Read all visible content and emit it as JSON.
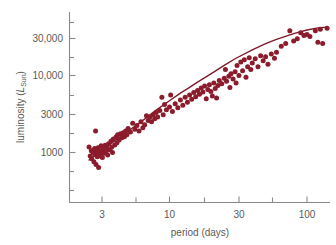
{
  "figure": {
    "name": "period-luminosity-diagram",
    "background": "#ffffff",
    "point_color": "#8b1c2c",
    "line_color": "#7d1a29",
    "axis_color": "#8a8a8a",
    "text_color": "#5a5a5a"
  },
  "axes": {
    "x_title": "period (days)",
    "y_title_main": "luminosity (",
    "y_title_italic": "L",
    "y_title_sub": "Sun",
    "y_title_close": ")",
    "x_tick_labels": [
      "3",
      "10",
      "30",
      "100"
    ],
    "y_tick_labels": [
      "1000",
      "3000",
      "10,000",
      "30,000"
    ]
  },
  "chart_data": {
    "type": "scatter",
    "title": "",
    "xlabel": "period (days)",
    "ylabel": "luminosity (L_Sun)",
    "xscale": "log",
    "yscale": "log",
    "xlim": [
      2.0,
      160
    ],
    "ylim": [
      400,
      70000
    ],
    "xticks": [
      3,
      10,
      30,
      100
    ],
    "xtick_labels": [
      "3",
      "10",
      "30",
      "100"
    ],
    "x_minor_ticks": [
      5,
      20,
      50
    ],
    "yticks": [
      1000,
      3000,
      10000,
      30000
    ],
    "ytick_labels": [
      "1000",
      "3000",
      "10,000",
      "30,000"
    ],
    "y_minor_ticks": [
      500,
      2000,
      5000,
      20000,
      50000
    ],
    "grid": false,
    "legend": false,
    "series": [
      {
        "name": "Cepheid variables",
        "marker": "filled-circle",
        "color": "#8b1c2c",
        "points": [
          [
            2.6,
            1180
          ],
          [
            2.65,
            900
          ],
          [
            2.7,
            1050
          ],
          [
            2.72,
            830
          ],
          [
            2.78,
            1000
          ],
          [
            2.82,
            760
          ],
          [
            2.85,
            1130
          ],
          [
            2.88,
            940
          ],
          [
            2.9,
            1900
          ],
          [
            2.92,
            700
          ],
          [
            2.95,
            1020
          ],
          [
            2.98,
            880
          ],
          [
            3.0,
            1000
          ],
          [
            3.02,
            1150
          ],
          [
            3.05,
            640
          ],
          [
            3.08,
            980
          ],
          [
            3.1,
            1060
          ],
          [
            3.15,
            900
          ],
          [
            3.18,
            1220
          ],
          [
            3.2,
            1000
          ],
          [
            3.25,
            860
          ],
          [
            3.3,
            1100
          ],
          [
            3.35,
            980
          ],
          [
            3.4,
            1240
          ],
          [
            3.45,
            1020
          ],
          [
            3.5,
            1150
          ],
          [
            3.55,
            930
          ],
          [
            3.6,
            1300
          ],
          [
            3.7,
            1080
          ],
          [
            3.75,
            1400
          ],
          [
            3.8,
            1180
          ],
          [
            3.85,
            1000
          ],
          [
            3.9,
            1500
          ],
          [
            4.0,
            1250
          ],
          [
            4.1,
            1600
          ],
          [
            4.15,
            1340
          ],
          [
            4.2,
            1700
          ],
          [
            4.3,
            1450
          ],
          [
            4.4,
            1750
          ],
          [
            4.5,
            1560
          ],
          [
            4.6,
            1800
          ],
          [
            4.7,
            1600
          ],
          [
            4.8,
            1900
          ],
          [
            4.9,
            1700
          ],
          [
            5.0,
            2050
          ],
          [
            5.2,
            1850
          ],
          [
            5.4,
            2400
          ],
          [
            5.6,
            2000
          ],
          [
            5.8,
            2250
          ],
          [
            6.0,
            1900
          ],
          [
            6.2,
            2500
          ],
          [
            6.4,
            2100
          ],
          [
            6.6,
            2300
          ],
          [
            6.8,
            3000
          ],
          [
            7.0,
            2600
          ],
          [
            7.2,
            2900
          ],
          [
            7.4,
            2500
          ],
          [
            7.6,
            3100
          ],
          [
            7.8,
            2750
          ],
          [
            8.0,
            3300
          ],
          [
            8.2,
            2900
          ],
          [
            8.5,
            3500
          ],
          [
            8.8,
            5200
          ],
          [
            9.0,
            3100
          ],
          [
            9.2,
            4200
          ],
          [
            9.5,
            3600
          ],
          [
            10.0,
            3900
          ],
          [
            10.2,
            5600
          ],
          [
            10.5,
            3400
          ],
          [
            11.0,
            4300
          ],
          [
            11.5,
            3800
          ],
          [
            12.0,
            4800
          ],
          [
            12.5,
            4100
          ],
          [
            13.0,
            5200
          ],
          [
            13.5,
            4500
          ],
          [
            14.0,
            5600
          ],
          [
            14.5,
            4900
          ],
          [
            15.0,
            6000
          ],
          [
            15.5,
            5300
          ],
          [
            16.0,
            6400
          ],
          [
            16.5,
            5700
          ],
          [
            17.0,
            6900
          ],
          [
            17.5,
            6100
          ],
          [
            18.0,
            7300
          ],
          [
            18.5,
            5000
          ],
          [
            19.0,
            6600
          ],
          [
            19.5,
            7600
          ],
          [
            20.0,
            6200
          ],
          [
            20.5,
            5400
          ],
          [
            21.0,
            8000
          ],
          [
            21.5,
            6800
          ],
          [
            22.0,
            5100
          ],
          [
            22.5,
            7400
          ],
          [
            23.0,
            8600
          ],
          [
            24.0,
            7800
          ],
          [
            25.0,
            9200
          ],
          [
            25.5,
            12000
          ],
          [
            26.0,
            8400
          ],
          [
            27.0,
            9800
          ],
          [
            27.5,
            7000
          ],
          [
            28.0,
            10500
          ],
          [
            29.0,
            9000
          ],
          [
            30.0,
            11200
          ],
          [
            30.5,
            8000
          ],
          [
            31.0,
            13500
          ],
          [
            32.0,
            10000
          ],
          [
            33.0,
            15000
          ],
          [
            34.0,
            11500
          ],
          [
            35.0,
            16000
          ],
          [
            36.0,
            9500
          ],
          [
            37.0,
            13000
          ],
          [
            38.0,
            17000
          ],
          [
            39.0,
            12000
          ],
          [
            40.0,
            14500
          ],
          [
            42.0,
            16500
          ],
          [
            44.0,
            13000
          ],
          [
            46.0,
            18000
          ],
          [
            48.0,
            15500
          ],
          [
            50.0,
            17500
          ],
          [
            52.0,
            14000
          ],
          [
            55.0,
            19000
          ],
          [
            58.0,
            16800
          ],
          [
            60.0,
            20000
          ],
          [
            65.0,
            24000
          ],
          [
            70.0,
            26000
          ],
          [
            75.0,
            38000
          ],
          [
            80.0,
            28000
          ],
          [
            85.0,
            30000
          ],
          [
            90.0,
            36000
          ],
          [
            95.0,
            33000
          ],
          [
            100.0,
            34000
          ],
          [
            105.0,
            32000
          ],
          [
            115.0,
            38000
          ],
          [
            120.0,
            27000
          ],
          [
            125.0,
            40000
          ],
          [
            130.0,
            26000
          ],
          [
            140.0,
            41000
          ]
        ]
      }
    ],
    "fit_curve": {
      "name": "period-luminosity relation",
      "color": "#7d1a29",
      "points": [
        [
          2.6,
          800
        ],
        [
          3.0,
          980
        ],
        [
          3.5,
          1180
        ],
        [
          4.0,
          1420
        ],
        [
          5.0,
          1900
        ],
        [
          6.0,
          2400
        ],
        [
          7.0,
          2950
        ],
        [
          8.0,
          3550
        ],
        [
          10.0,
          4700
        ],
        [
          12.0,
          5900
        ],
        [
          14.0,
          7000
        ],
        [
          16.0,
          8200
        ],
        [
          20.0,
          10500
        ],
        [
          25.0,
          13500
        ],
        [
          30.0,
          16500
        ],
        [
          40.0,
          21500
        ],
        [
          50.0,
          26000
        ],
        [
          60.0,
          29500
        ],
        [
          80.0,
          35000
        ],
        [
          100.0,
          39000
        ],
        [
          120.0,
          41500
        ],
        [
          140.0,
          42500
        ]
      ]
    }
  }
}
